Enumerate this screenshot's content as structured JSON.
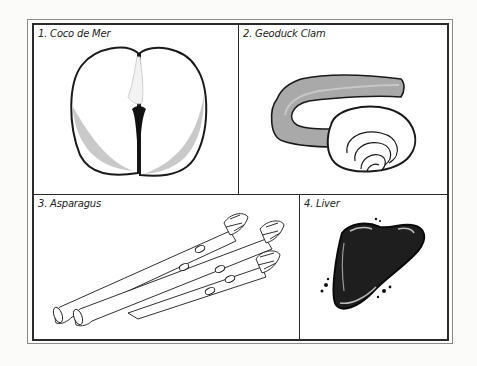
{
  "panels": [
    {
      "number": "1.",
      "label": "1. Coco de Mer",
      "subject": "coco-de-mer-seed"
    },
    {
      "number": "2.",
      "label": "2. Geoduck Clam",
      "subject": "geoduck-clam"
    },
    {
      "number": "3.",
      "label": "3. Asparagus",
      "subject": "asparagus-spears"
    },
    {
      "number": "4.",
      "label": "4. Liver",
      "subject": "liver-organ"
    }
  ],
  "colors": {
    "frame": "#2b2b2b",
    "outer_frame": "#8a8a8a",
    "shade": "#c9c9c9",
    "clam_body": "#a9a9a9",
    "liver": "#1e1e1e",
    "background": "#ffffff"
  }
}
